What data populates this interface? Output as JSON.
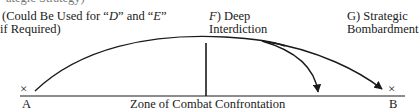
{
  "diagram": {
    "top_cut_text": "ategic Strategy)",
    "label_de": {
      "line1_pre": "(Could Be Used for “",
      "line1_d": "D",
      "line1_mid": "” and “",
      "line1_e": "E",
      "line1_post": "”",
      "line2": "if Required)"
    },
    "label_f": {
      "letter": "F",
      "paren": ")",
      "line1": "Deep",
      "line2": "Interdiction"
    },
    "label_g": {
      "line1": "G)  Strategic",
      "line2": "Bombardment"
    },
    "point_a": {
      "mark": "×",
      "label": "A"
    },
    "point_b": {
      "mark": "×",
      "label": "B"
    },
    "zone_label": "Zone of Combat Confrontation",
    "colors": {
      "ink": "#1a1a1a",
      "background": "#ffffff"
    }
  }
}
